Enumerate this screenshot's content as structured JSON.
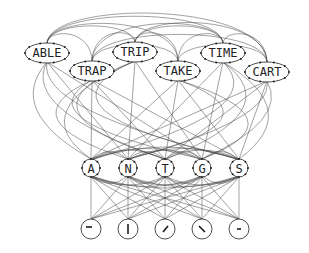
{
  "diagram": {
    "title": "",
    "word_nodes": [
      {
        "id": "able",
        "label": "ABLE",
        "x": 47,
        "y": 53
      },
      {
        "id": "trap",
        "label": "TRAP",
        "x": 92,
        "y": 71
      },
      {
        "id": "trip",
        "label": "TRIP",
        "x": 135,
        "y": 52
      },
      {
        "id": "take",
        "label": "TAKE",
        "x": 178,
        "y": 71
      },
      {
        "id": "time",
        "label": "TIME",
        "x": 223,
        "y": 53
      },
      {
        "id": "cart",
        "label": "CART",
        "x": 267,
        "y": 72
      }
    ],
    "letter_nodes": [
      {
        "id": "A",
        "label": "A",
        "x": 91,
        "y": 168
      },
      {
        "id": "N",
        "label": "N",
        "x": 128,
        "y": 168
      },
      {
        "id": "T",
        "label": "T",
        "x": 165,
        "y": 168
      },
      {
        "id": "G",
        "label": "G",
        "x": 202,
        "y": 168
      },
      {
        "id": "S",
        "label": "S",
        "x": 239,
        "y": 168
      }
    ],
    "feature_nodes": [
      {
        "id": "f1",
        "label": "horizontal-bar",
        "glyph": "—",
        "x": 91,
        "y": 229
      },
      {
        "id": "f2",
        "label": "vertical-bar",
        "glyph": "|",
        "x": 128,
        "y": 229
      },
      {
        "id": "f3",
        "label": "forward-diagonal",
        "glyph": "/",
        "x": 165,
        "y": 229
      },
      {
        "id": "f4",
        "label": "backward-diagonal",
        "glyph": "\\",
        "x": 202,
        "y": 229
      },
      {
        "id": "f5",
        "label": "short-bar",
        "glyph": "-",
        "x": 239,
        "y": 229
      }
    ],
    "colors": {
      "line": "#333333",
      "node_fill": "#ffffff",
      "text": "#222222"
    }
  }
}
